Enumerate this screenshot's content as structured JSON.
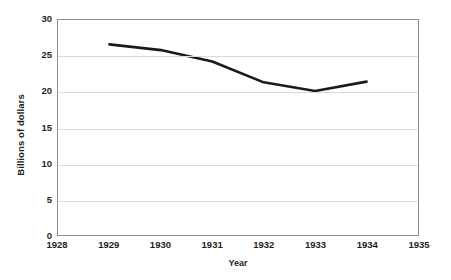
{
  "chart_data": {
    "type": "line",
    "title": "",
    "subtitle": "",
    "xlabel": "Year",
    "ylabel": "Billions of dollars",
    "x": [
      1929,
      1930,
      1931,
      1932,
      1933,
      1934
    ],
    "values": [
      26.6,
      25.8,
      24.2,
      21.3,
      20.1,
      21.4
    ],
    "series": [
      {
        "name": "Billions of dollars",
        "values": [
          26.6,
          25.8,
          24.2,
          21.3,
          20.1,
          21.4
        ]
      }
    ],
    "xlim": [
      1928,
      1935
    ],
    "ylim": [
      0,
      30
    ],
    "xticks": [
      1928,
      1929,
      1930,
      1931,
      1932,
      1933,
      1934,
      1935
    ],
    "xtick_labels": [
      "1928",
      "1929",
      "1930",
      "1931",
      "1932",
      "1933",
      "1934",
      "1935"
    ],
    "yticks": [
      0,
      5,
      10,
      15,
      20,
      25,
      30
    ],
    "ytick_labels": [
      "0",
      "5",
      "10",
      "15",
      "20",
      "25",
      "30"
    ],
    "grid": "horizontal",
    "legend": "none",
    "annotations": [],
    "colors": {
      "line": "#1a1a1a",
      "grid": "#d9d9d9",
      "axis": "#8d8d8d",
      "text": "#231f20",
      "background": "#ffffff"
    },
    "line_width": 2.6
  }
}
